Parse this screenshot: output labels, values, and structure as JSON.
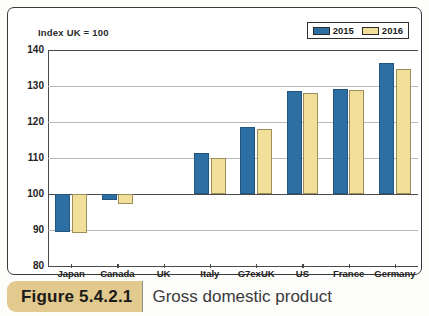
{
  "figure": {
    "number_label": "Figure 5.4.2.1",
    "caption": "Gross domestic product"
  },
  "chart_data": {
    "type": "bar",
    "title": "Gross domestic product",
    "subtitle": "Index UK = 100",
    "xlabel": "",
    "ylabel": "",
    "ylim": [
      80,
      140
    ],
    "yticks": [
      80,
      90,
      100,
      110,
      120,
      130,
      140
    ],
    "grid": true,
    "legend_position": "top-right",
    "categories": [
      "Japan",
      "Canada",
      "UK",
      "Italy",
      "G7exUK",
      "US",
      "France",
      "Germany"
    ],
    "series": [
      {
        "name": "2015",
        "color": "#2d6fa3",
        "values": [
          89.5,
          98.3,
          100.0,
          111.3,
          118.7,
          128.5,
          129.2,
          136.3
        ]
      },
      {
        "name": "2016",
        "color": "#f2df9a",
        "values": [
          89.3,
          97.2,
          100.0,
          110.0,
          118.0,
          128.0,
          128.8,
          134.8
        ]
      }
    ]
  },
  "legend": {
    "items": [
      {
        "label": "2015",
        "swatch": "blue-swatch"
      },
      {
        "label": "2016",
        "swatch": "yellow-swatch"
      }
    ]
  },
  "colors": {
    "series_2015": "#2d6fa3",
    "series_2016": "#f2df9a",
    "banner": "#e2c98d",
    "axis": "#4a4a4a",
    "gridline": "#b9b9b9"
  }
}
